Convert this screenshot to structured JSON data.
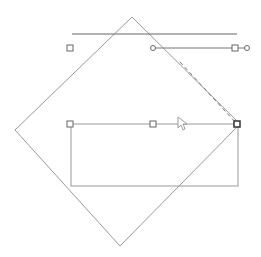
{
  "canvas": {
    "width": 261,
    "height": 257,
    "background": "#ffffff",
    "stroke_color": "#8a8a8a",
    "dark_stroke_color": "#555555"
  },
  "shapes": {
    "diamond": {
      "points": "132,17 240,124 120,246 15,130"
    },
    "top_line": {
      "x1": 72,
      "y1": 34,
      "x2": 237,
      "y2": 34
    },
    "connector_line": {
      "x1": 153,
      "y1": 48,
      "x2": 247,
      "y2": 48
    },
    "rectangle": {
      "x": 71,
      "y": 124,
      "width": 167,
      "height": 62
    },
    "dashed_guide": {
      "x1": 180,
      "y1": 62,
      "x2": 237,
      "y2": 124
    }
  },
  "handles": {
    "squares": [
      {
        "x": 70,
        "y": 48
      },
      {
        "x": 235,
        "y": 48
      },
      {
        "x": 70,
        "y": 124
      },
      {
        "x": 153,
        "y": 124
      },
      {
        "x": 237,
        "y": 124,
        "active": true
      }
    ],
    "circles": [
      {
        "x": 153,
        "y": 48
      },
      {
        "x": 247,
        "y": 48
      }
    ]
  },
  "cursor": {
    "x": 178,
    "y": 117,
    "icon": "arrow-pointer-icon"
  }
}
